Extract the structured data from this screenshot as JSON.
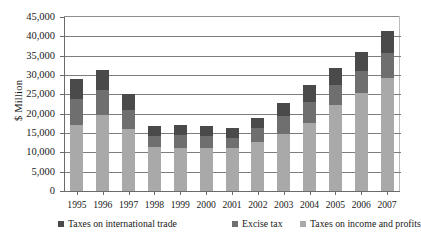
{
  "chart_data": {
    "type": "bar",
    "subtype": "stacked-column",
    "title": "",
    "xlabel": "",
    "ylabel": "$ Million",
    "ylim": [
      0,
      45000
    ],
    "ytick_values": [
      0,
      5000,
      10000,
      15000,
      20000,
      25000,
      30000,
      35000,
      40000,
      45000
    ],
    "ytick_labels": [
      "0",
      "5,000",
      "10,000",
      "15,000",
      "20,000",
      "25,000",
      "30,000",
      "35,000",
      "40,000",
      "45,000"
    ],
    "categories": [
      "1995",
      "1996",
      "1997",
      "1998",
      "1999",
      "2000",
      "2001",
      "2002",
      "2003",
      "2004",
      "2005",
      "2006",
      "2007"
    ],
    "grid": true,
    "legend_position": "bottom",
    "stack_order_bottom_to_top": [
      "Taxes on income and profits",
      "Excise tax",
      "Taxes on international trade"
    ],
    "series": [
      {
        "name": "Taxes on income and profits",
        "color": "#a9a9a9",
        "values": [
          17200,
          19600,
          16100,
          11300,
          11100,
          11200,
          11100,
          12600,
          14800,
          17600,
          22200,
          25400,
          29300
        ]
      },
      {
        "name": "Excise tax",
        "color": "#6f6f6f",
        "values": [
          6700,
          6500,
          4800,
          2900,
          3400,
          3100,
          2700,
          3600,
          4600,
          5500,
          5200,
          5700,
          6300
        ]
      },
      {
        "name": "Taxes on international trade",
        "color": "#4a4a4a",
        "values": [
          5100,
          5200,
          4300,
          2500,
          2600,
          2500,
          2400,
          2600,
          3400,
          4400,
          4300,
          4900,
          5800
        ]
      }
    ],
    "totals": [
      29000,
      31300,
      25200,
      16700,
      17100,
      16800,
      16200,
      18800,
      22800,
      27500,
      31700,
      36000,
      41400
    ]
  },
  "legend": {
    "items": [
      {
        "label": "Taxes on international trade",
        "color": "#4a4a4a"
      },
      {
        "label": "Excise tax",
        "color": "#6f6f6f"
      },
      {
        "label": "Taxes on income and profits",
        "color": "#a9a9a9"
      }
    ]
  }
}
